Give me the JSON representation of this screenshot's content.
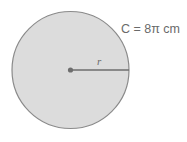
{
  "diagram": {
    "type": "circle",
    "circumference_label": "C = 8π cm",
    "radius_label": "r",
    "colors": {
      "fill": "#dcdcdc",
      "stroke": "#8a8a8a",
      "radius_line": "#6e6e6e",
      "text": "#6a6a6a"
    }
  }
}
